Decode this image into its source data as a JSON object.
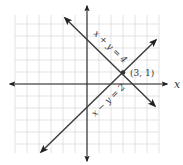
{
  "chart_data": {
    "type": "line",
    "title": "",
    "xlabel": "x",
    "ylabel": "",
    "xlim": [
      -6,
      6
    ],
    "ylim": [
      -6,
      6
    ],
    "grid": true,
    "series": [
      {
        "name": "x + y = 4",
        "equation": "y = 4 - x",
        "x": [
          -2,
          6
        ],
        "y": [
          6,
          -2
        ]
      },
      {
        "name": "x − y = 2",
        "equation": "y = x - 2",
        "x": [
          -4,
          6
        ],
        "y": [
          -6,
          4
        ]
      }
    ],
    "annotations": [
      {
        "text": "(3, 1)",
        "x": 3,
        "y": 1,
        "type": "intersection-point"
      }
    ]
  },
  "labels": {
    "x_axis": "x",
    "line1": "x + y = 4",
    "line2": "x − y = 2",
    "point": "(3, 1)"
  },
  "colors": {
    "line": "#3a3a3a",
    "grid": "#d9d9d9",
    "point": "#333333"
  }
}
